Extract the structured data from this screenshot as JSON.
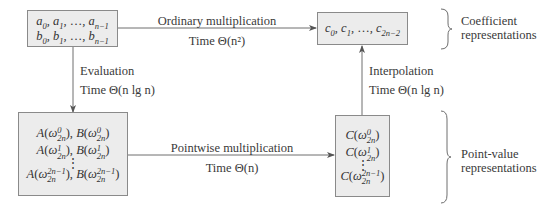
{
  "diagram": {
    "boxes": {
      "input_coefficients": {
        "line1": "a_0, a_1, ..., a_{n-1}",
        "line2": "b_0, b_1, ..., b_{n-1}"
      },
      "output_coefficients": {
        "line1": "c_0, c_1, ..., c_{2n-2}"
      },
      "input_point_values": {
        "rows": [
          "A(ω_2n^0), B(ω_2n^0)",
          "A(ω_2n^1), B(ω_2n^1)",
          "⋮",
          "A(ω_2n^{2n-1}), B(ω_2n^{2n-1})"
        ]
      },
      "output_point_values": {
        "rows": [
          "C(ω_2n^0)",
          "C(ω_2n^1)",
          "⋮",
          "C(ω_2n^{2n-1})"
        ]
      }
    },
    "edges": {
      "ordinary": {
        "label": "Ordinary multiplication",
        "time": "Time Θ(n²)"
      },
      "evaluation": {
        "label": "Evaluation",
        "time": "Time Θ(n lg n)"
      },
      "pointwise": {
        "label": "Pointwise multiplication",
        "time": "Time Θ(n)"
      },
      "interpolation": {
        "label": "Interpolation",
        "time": "Time Θ(n lg n)"
      }
    },
    "groups": {
      "coefficient": {
        "line1": "Coefficient",
        "line2": "representations"
      },
      "point_value": {
        "line1": "Point-value",
        "line2": "representations"
      }
    },
    "symbols": {
      "a": "a",
      "b": "b",
      "c": "c",
      "A": "A",
      "B": "B",
      "C": "C",
      "omega": "ω",
      "ellipsis": "…",
      "vdots": "⋮",
      "sub_0": "0",
      "sub_1": "1",
      "sub_n1": "n−1",
      "sub_2n2": "2n−2",
      "sub_2n": "2n",
      "sup_0": "0",
      "sup_1": "1",
      "sup_2n1": "2n−1"
    },
    "colors": {
      "box_fill": "#ececec",
      "box_border": "#8a8a8a",
      "line": "#6e6e6e",
      "text": "#3a3a3a"
    }
  }
}
